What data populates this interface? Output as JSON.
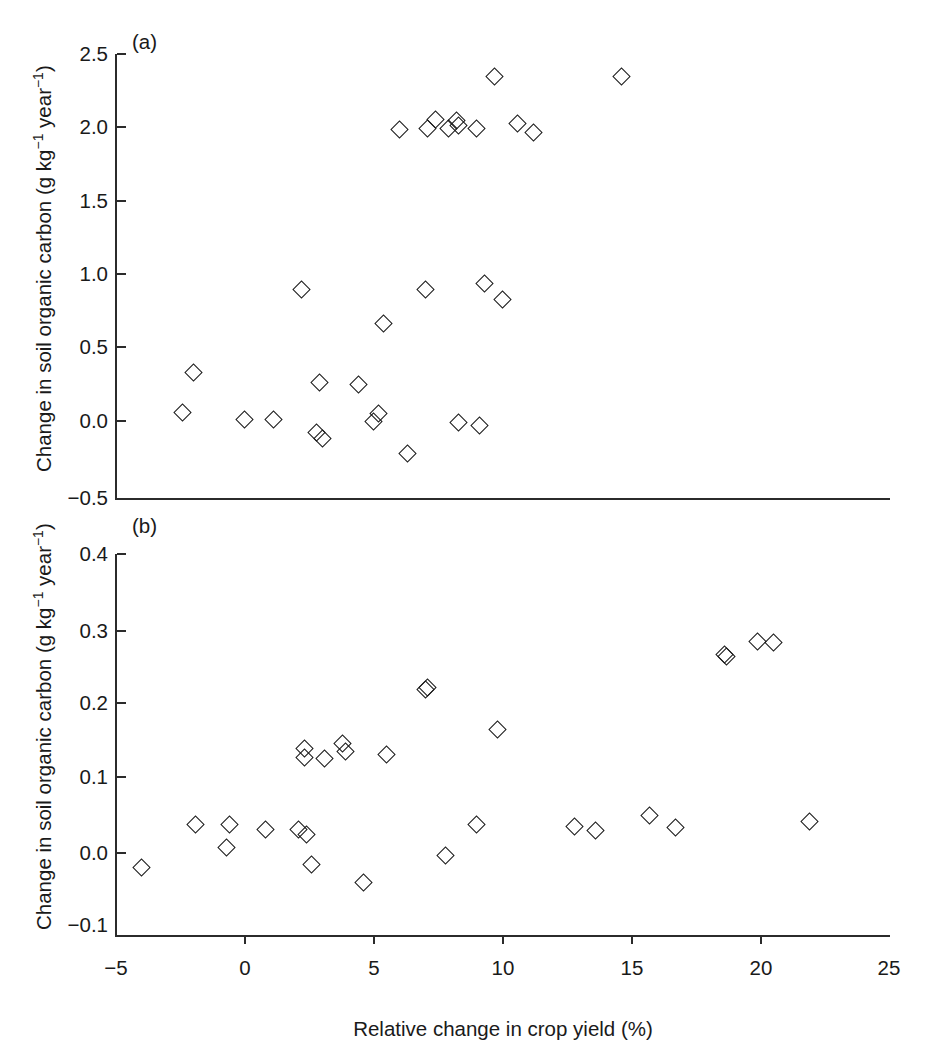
{
  "figure": {
    "xlabel": "Relative change in crop yield (%)",
    "ylabel": "Change in soil organic carbon (g kg",
    "ylabel_sup1": "−1",
    "ylabel_mid": " year",
    "ylabel_sup2": "−1",
    "ylabel_end": ")",
    "marker_color": "#1a1a1a",
    "axis_color": "#2b2b2b",
    "background": "#ffffff"
  },
  "panel_a": {
    "letter": "(a)",
    "yticks": [
      "2.5",
      "2.0",
      "1.5",
      "1.0",
      "0.5",
      "0.0",
      "−0.5"
    ],
    "xticks": []
  },
  "panel_b": {
    "letter": "(b)",
    "yticks": [
      "0.4",
      "0.3",
      "0.2",
      "0.1",
      "0.0",
      "−0.1"
    ],
    "xticks": [
      "−5",
      "0",
      "5",
      "10",
      "15",
      "20",
      "25"
    ]
  },
  "chart_data": [
    {
      "type": "scatter",
      "panel": "(a)",
      "title": "",
      "xlabel": "Relative change in crop yield (%)",
      "ylabel": "Change in soil organic carbon (g kg-1 year-1)",
      "xlim": [
        -5,
        25
      ],
      "ylim": [
        -0.5,
        2.5
      ],
      "xticks": [
        -5,
        0,
        5,
        10,
        15,
        20,
        25
      ],
      "yticks": [
        -0.5,
        0.0,
        0.5,
        1.0,
        1.5,
        2.0,
        2.5
      ],
      "grid": false,
      "legend": null,
      "marker": "open-diamond",
      "points": [
        {
          "x": -2.0,
          "y": 0.35
        },
        {
          "x": -2.4,
          "y": 0.08
        },
        {
          "x": 0.0,
          "y": 0.03
        },
        {
          "x": 1.1,
          "y": 0.03
        },
        {
          "x": 2.8,
          "y": -0.06
        },
        {
          "x": 3.0,
          "y": -0.1
        },
        {
          "x": 2.9,
          "y": 0.28
        },
        {
          "x": 2.2,
          "y": 0.91
        },
        {
          "x": 4.4,
          "y": 0.27
        },
        {
          "x": 5.0,
          "y": 0.02
        },
        {
          "x": 5.2,
          "y": 0.07
        },
        {
          "x": 5.4,
          "y": 0.68
        },
        {
          "x": 6.0,
          "y": 1.99
        },
        {
          "x": 6.3,
          "y": -0.2
        },
        {
          "x": 7.0,
          "y": 0.91
        },
        {
          "x": 7.1,
          "y": 2.0
        },
        {
          "x": 7.4,
          "y": 2.06
        },
        {
          "x": 7.9,
          "y": 2.0
        },
        {
          "x": 8.2,
          "y": 2.05
        },
        {
          "x": 8.3,
          "y": 2.02
        },
        {
          "x": 8.3,
          "y": 0.01
        },
        {
          "x": 9.1,
          "y": -0.01
        },
        {
          "x": 9.0,
          "y": 2.0
        },
        {
          "x": 9.3,
          "y": 0.95
        },
        {
          "x": 9.7,
          "y": 2.35
        },
        {
          "x": 10.0,
          "y": 0.84
        },
        {
          "x": 10.6,
          "y": 2.03
        },
        {
          "x": 11.2,
          "y": 1.97
        },
        {
          "x": 14.6,
          "y": 2.35
        }
      ]
    },
    {
      "type": "scatter",
      "panel": "(b)",
      "title": "",
      "xlabel": "Relative change in crop yield (%)",
      "ylabel": "Change in soil organic carbon (g kg-1 year-1)",
      "xlim": [
        -5,
        25
      ],
      "ylim": [
        -0.1,
        0.4
      ],
      "xticks": [
        -5,
        0,
        5,
        10,
        15,
        20,
        25
      ],
      "yticks": [
        -0.1,
        0.0,
        0.1,
        0.2,
        0.3,
        0.4
      ],
      "grid": false,
      "legend": null,
      "marker": "open-diamond",
      "points": [
        {
          "x": -4.0,
          "y": -0.022
        },
        {
          "x": -1.9,
          "y": 0.036
        },
        {
          "x": -0.6,
          "y": 0.036
        },
        {
          "x": -0.7,
          "y": 0.004
        },
        {
          "x": 0.8,
          "y": 0.029
        },
        {
          "x": 2.1,
          "y": 0.029
        },
        {
          "x": 2.4,
          "y": 0.022
        },
        {
          "x": 2.3,
          "y": 0.126
        },
        {
          "x": 2.3,
          "y": 0.138
        },
        {
          "x": 2.6,
          "y": -0.018
        },
        {
          "x": 3.1,
          "y": 0.125
        },
        {
          "x": 3.8,
          "y": 0.145
        },
        {
          "x": 3.9,
          "y": 0.134
        },
        {
          "x": 4.6,
          "y": -0.043
        },
        {
          "x": 5.5,
          "y": 0.13
        },
        {
          "x": 7.0,
          "y": 0.218
        },
        {
          "x": 7.1,
          "y": 0.22
        },
        {
          "x": 7.8,
          "y": -0.007
        },
        {
          "x": 9.0,
          "y": 0.035
        },
        {
          "x": 9.8,
          "y": 0.164
        },
        {
          "x": 12.8,
          "y": 0.033
        },
        {
          "x": 13.6,
          "y": 0.028
        },
        {
          "x": 15.7,
          "y": 0.048
        },
        {
          "x": 16.7,
          "y": 0.031
        },
        {
          "x": 18.6,
          "y": 0.265
        },
        {
          "x": 18.7,
          "y": 0.262
        },
        {
          "x": 19.9,
          "y": 0.282
        },
        {
          "x": 20.5,
          "y": 0.281
        },
        {
          "x": 21.9,
          "y": 0.04
        }
      ]
    }
  ]
}
